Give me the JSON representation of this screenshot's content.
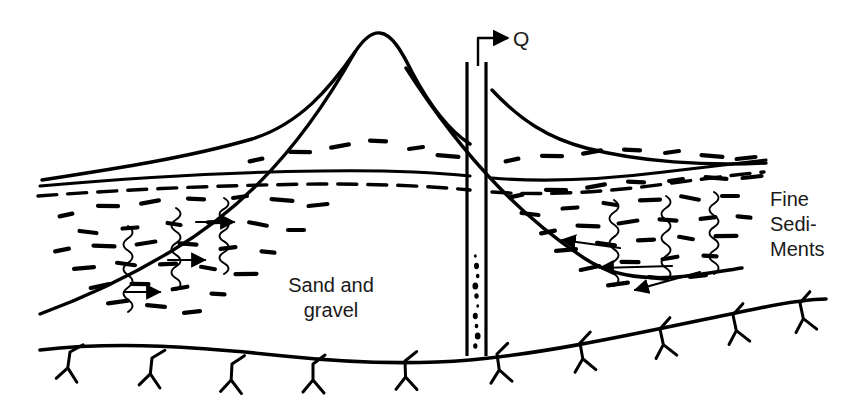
{
  "figure": {
    "type": "hydrogeologic-cross-section",
    "background_color": "#ffffff",
    "ink_color": "#000000"
  },
  "labels": {
    "discharge": "Q",
    "aquifer_line_1": "Sand and",
    "aquifer_line_2": "gravel",
    "confining_line_1": "Fine",
    "confining_line_2": "Sedi-",
    "confining_line_3": "Ments"
  },
  "label_positions": {
    "discharge": {
      "x": 513,
      "y": 46
    },
    "aquifer_line_1": {
      "x": 331,
      "y": 292
    },
    "aquifer_line_2": {
      "x": 331,
      "y": 317
    },
    "confining_line_1": {
      "x": 770,
      "y": 206
    },
    "confining_line_2": {
      "x": 770,
      "y": 231
    },
    "confining_line_3": {
      "x": 770,
      "y": 256
    }
  },
  "geometry": {
    "ground_surface": "M 42,180 C 120,168 190,157 252,139 C 300,124 330,88 355,52 C 363,40 372,32 380,33 C 392,34 402,52 412,72 C 430,106 448,130 470,144",
    "ground_surface_right": "M 492,90 C 520,120 548,138 586,148 C 640,162 706,166 766,163",
    "sediment_base_left": "M 40,186 C 130,178 230,172 320,171 C 380,170 430,172 470,176",
    "sediment_base_right": "M 492,178 C 540,182 600,180 664,172 C 706,167 740,163 766,160",
    "water_table_left": "M 38,196 C 130,189 230,185 320,184 C 380,184 430,186 470,190",
    "water_table_right": "M 492,192 C 545,196 610,192 672,183 C 710,178 742,174 764,172",
    "contact_left": "M 40,314 C 78,300 120,282 170,252 C 225,219 290,168 355,52",
    "contact_right": "M 406,68 C 470,168 530,222 584,258 C 630,289 690,276 742,268",
    "bedrock": "M 40,350 C 120,341 200,347 284,356 C 360,364 420,364 470,360 C 560,352 660,328 760,308 C 790,302 812,299 826,299",
    "bedrock_ticks": [
      {
        "x": 70,
        "y": 352,
        "rot": 8
      },
      {
        "x": 152,
        "y": 358,
        "rot": 6
      },
      {
        "x": 232,
        "y": 364,
        "rot": 3
      },
      {
        "x": 313,
        "y": 364,
        "rot": 0
      },
      {
        "x": 405,
        "y": 361,
        "rot": -2
      },
      {
        "x": 497,
        "y": 354,
        "rot": -8
      },
      {
        "x": 580,
        "y": 343,
        "rot": -10
      },
      {
        "x": 660,
        "y": 329,
        "rot": -12
      },
      {
        "x": 733,
        "y": 315,
        "rot": -12
      },
      {
        "x": 800,
        "y": 303,
        "rot": -12
      }
    ],
    "well": {
      "left_casing_x": 467,
      "right_casing_x": 486,
      "top_y": 62,
      "bottom_y": 356,
      "screen_top_y": 252,
      "screen_dots": [
        256,
        266,
        276,
        286,
        296,
        306,
        316,
        326,
        336,
        346
      ]
    },
    "discharge_pipe": {
      "riser_x": 478,
      "riser_top_y": 38,
      "riser_bottom_y": 66,
      "elbow_to_x": 494,
      "arrow_tip_x": 508,
      "arrow_y": 38
    },
    "flow_arrows_left": [
      {
        "x1": 124,
        "y1": 292,
        "x2": 160,
        "y2": 292
      },
      {
        "x1": 168,
        "y1": 260,
        "x2": 205,
        "y2": 260
      },
      {
        "x1": 196,
        "y1": 222,
        "x2": 234,
        "y2": 222
      }
    ],
    "flow_arrows_right": [
      {
        "x1": 620,
        "y1": 248,
        "x2": 562,
        "y2": 240
      },
      {
        "x1": 672,
        "y1": 266,
        "x2": 600,
        "y2": 268
      },
      {
        "x1": 700,
        "y1": 272,
        "x2": 635,
        "y2": 290
      }
    ]
  },
  "texture": {
    "dashes_left": [
      [
        66,
        215
      ],
      [
        108,
        206
      ],
      [
        150,
        202
      ],
      [
        196,
        199
      ],
      [
        240,
        197
      ],
      [
        282,
        200
      ],
      [
        318,
        205
      ],
      [
        88,
        232
      ],
      [
        130,
        228
      ],
      [
        174,
        224
      ],
      [
        218,
        222
      ],
      [
        258,
        224
      ],
      [
        296,
        230
      ],
      [
        62,
        250
      ],
      [
        104,
        246
      ],
      [
        146,
        243
      ],
      [
        188,
        244
      ],
      [
        228,
        248
      ],
      [
        268,
        252
      ],
      [
        84,
        268
      ],
      [
        126,
        264
      ],
      [
        168,
        264
      ],
      [
        208,
        268
      ],
      [
        246,
        274
      ],
      [
        100,
        286
      ],
      [
        140,
        284
      ],
      [
        180,
        288
      ],
      [
        218,
        294
      ],
      [
        118,
        302
      ],
      [
        156,
        306
      ],
      [
        192,
        312
      ]
    ],
    "dashes_right": [
      [
        516,
        196
      ],
      [
        556,
        190
      ],
      [
        596,
        186
      ],
      [
        636,
        182
      ],
      [
        676,
        180
      ],
      [
        716,
        178
      ],
      [
        752,
        177
      ],
      [
        530,
        214
      ],
      [
        570,
        208
      ],
      [
        610,
        204
      ],
      [
        650,
        200
      ],
      [
        690,
        198
      ],
      [
        730,
        196
      ],
      [
        548,
        232
      ],
      [
        588,
        226
      ],
      [
        628,
        222
      ],
      [
        668,
        220
      ],
      [
        708,
        218
      ],
      [
        744,
        217
      ],
      [
        566,
        250
      ],
      [
        606,
        244
      ],
      [
        646,
        240
      ],
      [
        686,
        238
      ],
      [
        726,
        236
      ],
      [
        590,
        268
      ],
      [
        630,
        262
      ],
      [
        670,
        258
      ],
      [
        710,
        256
      ],
      [
        618,
        284
      ],
      [
        658,
        278
      ],
      [
        698,
        276
      ]
    ],
    "dashes_wedge_left": [
      [
        256,
        160
      ],
      [
        300,
        152
      ],
      [
        340,
        146
      ],
      [
        378,
        141
      ],
      [
        416,
        148
      ],
      [
        448,
        156
      ]
    ],
    "dashes_wedge_right": [
      [
        512,
        160
      ],
      [
        552,
        156
      ],
      [
        592,
        152
      ],
      [
        632,
        150
      ],
      [
        672,
        152
      ],
      [
        712,
        156
      ],
      [
        746,
        158
      ]
    ],
    "squiggles_left": [
      {
        "x": 128,
        "y": 226,
        "h": 86
      },
      {
        "x": 176,
        "y": 208,
        "h": 82
      },
      {
        "x": 224,
        "y": 198,
        "h": 76
      }
    ],
    "squiggles_right": [
      {
        "x": 614,
        "y": 200,
        "h": 86
      },
      {
        "x": 666,
        "y": 196,
        "h": 84
      },
      {
        "x": 714,
        "y": 192,
        "h": 82
      }
    ]
  }
}
